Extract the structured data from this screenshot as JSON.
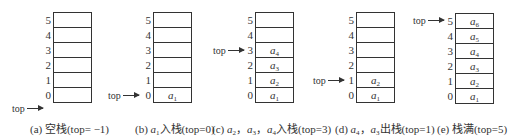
{
  "diagram": {
    "pointer_label": "top",
    "indices": [
      "5",
      "4",
      "3",
      "2",
      "1",
      "0"
    ],
    "panels": [
      {
        "id": "a",
        "cells_top_to_bottom": [
          "",
          "",
          "",
          "",
          "",
          ""
        ],
        "top": -1,
        "caption_prefix": "(a) 空栈(top= −1)",
        "caption": "(a) 空栈(top= −1)"
      },
      {
        "id": "b",
        "cells_top_to_bottom": [
          "",
          "",
          "",
          "",
          "",
          "a1"
        ],
        "top": 0,
        "caption": "(b) a1入栈(top=0)"
      },
      {
        "id": "c",
        "cells_top_to_bottom": [
          "",
          "",
          "a4",
          "a3",
          "a2",
          "a1"
        ],
        "top": 3,
        "caption": "(c) a2，a3，a4入栈(top=3)"
      },
      {
        "id": "d",
        "cells_top_to_bottom": [
          "",
          "",
          "",
          "",
          "a2",
          "a1"
        ],
        "top": 1,
        "caption": "(d) a4，a3出栈(top=1)"
      },
      {
        "id": "e",
        "cells_top_to_bottom": [
          "a6",
          "a5",
          "a4",
          "a3",
          "a2",
          "a1"
        ],
        "top": 5,
        "caption": "(e) 栈满(top=5)"
      }
    ]
  }
}
